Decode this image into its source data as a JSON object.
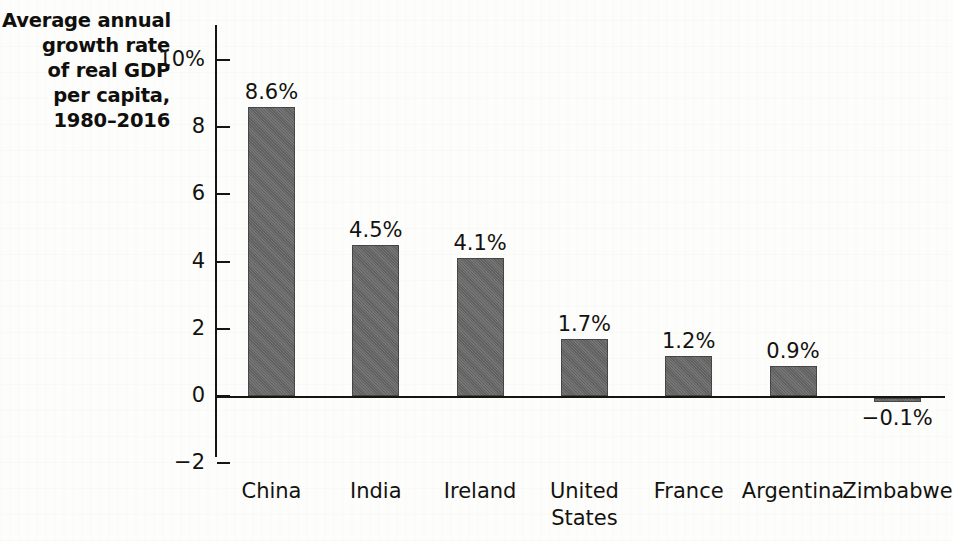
{
  "figure": {
    "title_lines": [
      "Average annual",
      "growth rate",
      "of real GDP",
      "per capita,",
      "1980–2016"
    ],
    "bar_color": "#676767",
    "axis_color": "#17150f",
    "background_color": "#fdfdfc"
  },
  "chart_data": {
    "type": "bar",
    "title": "Average annual growth rate of real GDP per capita, 1980–2016",
    "xlabel": "",
    "ylabel": "",
    "categories": [
      "China",
      "India",
      "Ireland",
      "United\nStates",
      "France",
      "Argentina",
      "Zimbabwe"
    ],
    "values": [
      8.6,
      4.5,
      4.1,
      1.7,
      1.2,
      0.9,
      -0.1
    ],
    "data_labels": [
      "8.6%",
      "4.5%",
      "4.1%",
      "1.7%",
      "1.2%",
      "0.9%",
      "−0.1%"
    ],
    "ylim": [
      -2,
      11
    ],
    "yticks": [
      10,
      8,
      6,
      4,
      2,
      0,
      -2
    ],
    "ytick_labels": [
      "10%",
      "8",
      "6",
      "4",
      "2",
      "0",
      "−2"
    ],
    "grid": false,
    "legend": false,
    "units": "percent"
  }
}
